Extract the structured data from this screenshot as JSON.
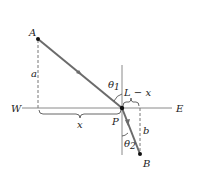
{
  "diagram": {
    "type": "refraction-path",
    "labels": {
      "point_a": "A",
      "point_b": "B",
      "point_p": "P",
      "west": "W",
      "east": "E",
      "height_a": "a",
      "height_b": "b",
      "dist_x": "x",
      "dist_l_minus_x": "L − x",
      "theta1": "θ",
      "theta1_sub": "1",
      "theta2": "θ",
      "theta2_sub": "2"
    },
    "colors": {
      "ray": "#6b6b6b",
      "axis": "#888888",
      "dashed": "#777777",
      "point": "#111111"
    }
  }
}
